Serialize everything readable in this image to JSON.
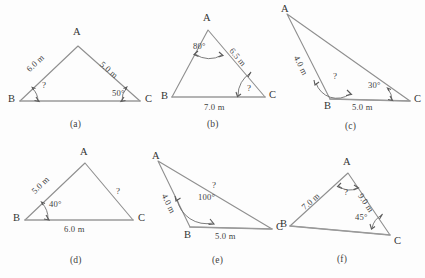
{
  "page": {
    "background_color": "#fdfdfd",
    "line_color": "#8f8f8f",
    "text_color": "#3e3e3e"
  },
  "figures": [
    {
      "caption": "(a)",
      "vertices": {
        "A": "A",
        "B": "B",
        "C": "C"
      },
      "labels": {
        "side_ab": "6.0 m",
        "side_ac": "5.0 m",
        "angle_b": "?",
        "angle_c": "50°"
      }
    },
    {
      "caption": "(b)",
      "vertices": {
        "A": "A",
        "B": "B",
        "C": "C"
      },
      "labels": {
        "angle_a": "80°",
        "side_ac": "6.5 m",
        "side_bc": "7.0 m",
        "angle_c": "?"
      }
    },
    {
      "caption": "(c)",
      "vertices": {
        "A": "A",
        "B": "B",
        "C": "C"
      },
      "labels": {
        "side_ab": "4.0 m",
        "angle_b": "?",
        "angle_c": "30°",
        "side_bc": "5.0 m"
      }
    },
    {
      "caption": "(d)",
      "vertices": {
        "A": "A",
        "B": "B",
        "C": "C"
      },
      "labels": {
        "side_ab": "5.0 m",
        "side_ac": "?",
        "angle_b": "40°",
        "side_bc": "6.0 m"
      }
    },
    {
      "caption": "(e)",
      "vertices": {
        "A": "A",
        "B": "B",
        "C": "C"
      },
      "labels": {
        "side_ab": "4.0 m",
        "side_ac": "?",
        "angle_b": "100°",
        "side_bc": "5.0 m"
      }
    },
    {
      "caption": "(f)",
      "vertices": {
        "A": "A",
        "B": "B",
        "C": "C"
      },
      "labels": {
        "side_ab": "7.0 m",
        "side_ac": "9.0 m",
        "angle_a": "?",
        "angle_c": "45°"
      }
    }
  ]
}
